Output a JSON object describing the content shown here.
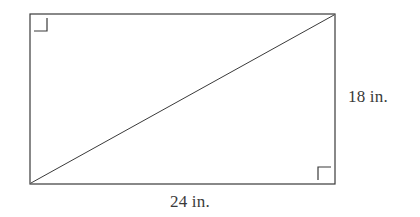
{
  "figure": {
    "kind": "geometry-diagram",
    "background_color": "#ffffff",
    "stroke_color": "#3a3a3a",
    "text_color": "#3a3a3a",
    "rectangle": {
      "x": 30,
      "y": 14,
      "width": 305,
      "height": 170,
      "stroke_width": 1.2
    },
    "diagonal": {
      "x1": 31,
      "y1": 183,
      "x2": 334,
      "y2": 15,
      "stroke_width": 1
    },
    "right_angle_markers": [
      {
        "name": "top-left",
        "x": 34,
        "y": 18,
        "size": 13
      },
      {
        "name": "bottom-right",
        "x": 318,
        "y": 167,
        "size": 13
      }
    ],
    "labels": {
      "height": "18 in.",
      "width": "24 in."
    }
  }
}
